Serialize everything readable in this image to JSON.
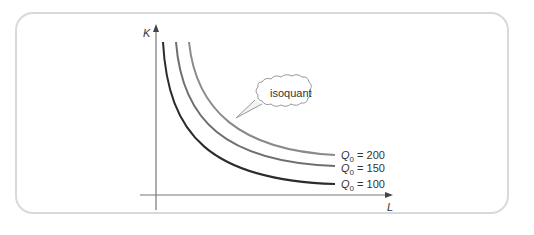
{
  "diagram": {
    "axes": {
      "y_label": "K",
      "x_label": "L"
    },
    "callout": {
      "text": "isoquant"
    },
    "curves": [
      {
        "name": "Q0",
        "value": "200",
        "label": "Q0 = 200",
        "color": "#8a8a8a"
      },
      {
        "name": "Q0",
        "value": "150",
        "label": "Q0 = 150",
        "color": "#6e6e6e"
      },
      {
        "name": "Q0",
        "value": "100",
        "label": "Q0 = 100",
        "color": "#2b2b2b"
      }
    ]
  },
  "labels": {
    "q_symbol": "Q",
    "q_sub": "0",
    "eq": " = ",
    "v200": "200",
    "v150": "150",
    "v100": "100"
  }
}
